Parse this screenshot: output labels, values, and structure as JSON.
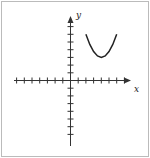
{
  "chart_data": {
    "type": "line",
    "title": "",
    "xlabel": "x",
    "ylabel": "y",
    "xlim": [
      -7,
      7
    ],
    "ylim": [
      -7,
      7
    ],
    "grid": false,
    "tick_spacing": 1,
    "tick_labels": false,
    "series": [
      {
        "name": "parabola",
        "x": [
          2,
          2.5,
          3,
          3.5,
          4,
          4.5,
          5,
          5.5,
          6
        ],
        "y": [
          6,
          4.69,
          3.75,
          3.19,
          3,
          3.19,
          3.75,
          4.69,
          6
        ]
      }
    ],
    "annotation": "upward-opening parabola with vertex at (4, 3)"
  },
  "axes": {
    "x_label": "x",
    "y_label": "y"
  }
}
